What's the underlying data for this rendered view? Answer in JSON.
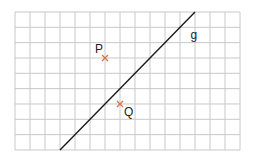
{
  "diagram": {
    "type": "coordinate-grid",
    "grid": {
      "columns": 15,
      "rows": 9,
      "origin_px": [
        15,
        12
      ],
      "cell_w": 15,
      "cell_h": 15.33,
      "line_color": "#c8c8c8"
    },
    "line": {
      "label": "g",
      "from_grid": [
        3,
        9
      ],
      "to_grid": [
        12,
        0
      ],
      "color": "#1a1a1a"
    },
    "points": [
      {
        "label": "P",
        "grid": [
          6,
          3
        ],
        "color": "#d9734a"
      },
      {
        "label": "Q",
        "grid": [
          7,
          6
        ],
        "color": "#d9734a"
      }
    ],
    "labels": {
      "line_g": "g",
      "point_p": "P",
      "point_q": "Q"
    }
  }
}
